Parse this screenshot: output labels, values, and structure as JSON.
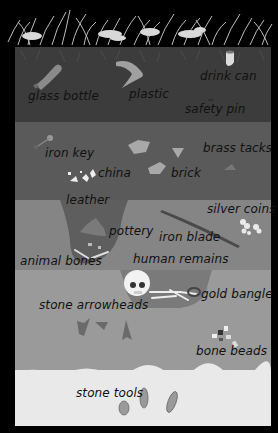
{
  "diagram": {
    "type": "soil-layer-cross-section",
    "theme": "grayscale",
    "colors": {
      "background": "#000000",
      "grass": "#bdbdbd",
      "layer_topsoil": "#3c3c3c",
      "layer_medieval": "#5a5a5a",
      "layer_roman": "#858585",
      "layer_bronze": "#9a9a9a",
      "layer_stone": "#e9e9e9",
      "pit_fill": "#5e5e5e",
      "label_text": "#111111"
    },
    "layers": [
      {
        "id": "topsoil",
        "labels": [
          {
            "text": "glass bottle",
            "x": 28,
            "y": 89
          },
          {
            "text": "plastic",
            "x": 129,
            "y": 87
          },
          {
            "text": "drink can",
            "x": 200,
            "y": 69
          },
          {
            "text": "safety pin",
            "x": 185,
            "y": 102
          }
        ]
      },
      {
        "id": "medieval",
        "labels": [
          {
            "text": "iron key",
            "x": 45,
            "y": 146
          },
          {
            "text": "brass tacks",
            "x": 203,
            "y": 141
          },
          {
            "text": "china",
            "x": 98,
            "y": 166
          },
          {
            "text": "brick",
            "x": 171,
            "y": 166
          },
          {
            "text": "leather",
            "x": 66,
            "y": 193
          }
        ]
      },
      {
        "id": "roman",
        "labels": [
          {
            "text": "silver coins",
            "x": 207,
            "y": 202
          },
          {
            "text": "pottery",
            "x": 109,
            "y": 224
          },
          {
            "text": "iron blade",
            "x": 159,
            "y": 230
          },
          {
            "text": "animal bones",
            "x": 20,
            "y": 254
          },
          {
            "text": "human remains",
            "x": 133,
            "y": 252
          }
        ]
      },
      {
        "id": "bronze",
        "labels": [
          {
            "text": "gold bangle",
            "x": 201,
            "y": 287
          },
          {
            "text": "stone arrowheads",
            "x": 39,
            "y": 298
          },
          {
            "text": "bone beads",
            "x": 196,
            "y": 344
          }
        ]
      },
      {
        "id": "stone",
        "labels": [
          {
            "text": "stone tools",
            "x": 76,
            "y": 386
          }
        ]
      }
    ]
  }
}
